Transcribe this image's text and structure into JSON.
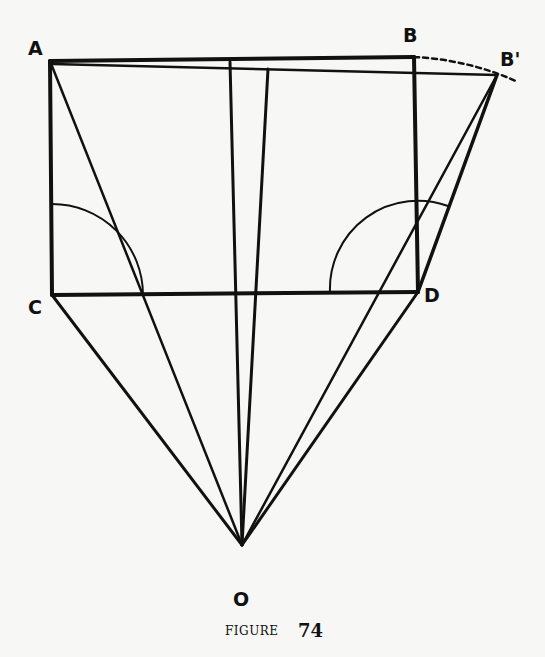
{
  "figure": {
    "caption_word": "FIGURE",
    "caption_number": "74"
  },
  "points": {
    "A": {
      "label": "A",
      "x": 50,
      "y": 61
    },
    "B": {
      "label": "B",
      "x": 414,
      "y": 57
    },
    "B_prime": {
      "label": "B'",
      "x": 497,
      "y": 75
    },
    "C": {
      "label": "C",
      "x": 52,
      "y": 295
    },
    "D": {
      "label": "D",
      "x": 418,
      "y": 292
    },
    "O": {
      "label": "O",
      "x": 242,
      "y": 545
    }
  },
  "colors": {
    "ink": "#111111",
    "paper": "#f7f7f5"
  }
}
